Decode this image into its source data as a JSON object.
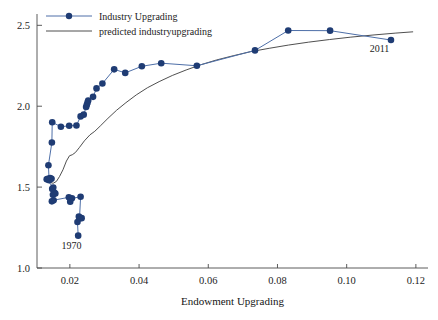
{
  "chart_data": {
    "type": "scatter",
    "title": "",
    "subtitle": "",
    "xlabel": "Endowment Upgrading",
    "ylabel": "",
    "xlim": [
      0.0105,
      0.1235
    ],
    "ylim": [
      1.0,
      2.57
    ],
    "grid": false,
    "legend_position": "top-left",
    "x_ticks": [
      0.02,
      0.04,
      0.06,
      0.08,
      0.1,
      0.12
    ],
    "x_tick_labels": [
      "0.02",
      "0.04",
      "0.06",
      "0.08",
      "0.10",
      "0.12"
    ],
    "y_ticks": [
      1.0,
      1.5,
      2.0,
      2.5
    ],
    "y_tick_labels": [
      "1.0",
      "1.5",
      "2.0",
      "2.5"
    ],
    "annotations": [
      {
        "text": "1970",
        "x": 0.0205,
        "y": 1.115
      },
      {
        "text": "2011",
        "x": 0.1095,
        "y": 2.335
      }
    ],
    "series": [
      {
        "name": "Industry Upgrading",
        "style": "line-marker",
        "color": "#1f3c74",
        "line_color": "#4e6fa8",
        "points": [
          [
            0.0224,
            1.2
          ],
          [
            0.0222,
            1.284
          ],
          [
            0.0229,
            1.307
          ],
          [
            0.0234,
            1.308
          ],
          [
            0.0226,
            1.318
          ],
          [
            0.0228,
            1.312
          ],
          [
            0.0231,
            1.44
          ],
          [
            0.0206,
            1.431
          ],
          [
            0.0201,
            1.41
          ],
          [
            0.0197,
            1.437
          ],
          [
            0.0153,
            1.419
          ],
          [
            0.0148,
            1.412
          ],
          [
            0.0151,
            1.452
          ],
          [
            0.0155,
            1.466
          ],
          [
            0.0158,
            1.46
          ],
          [
            0.0149,
            1.489
          ],
          [
            0.0152,
            1.497
          ],
          [
            0.0133,
            1.548
          ],
          [
            0.0136,
            1.552
          ],
          [
            0.0143,
            1.556
          ],
          [
            0.0147,
            1.551
          ],
          [
            0.014,
            1.543
          ],
          [
            0.0138,
            1.635
          ],
          [
            0.0148,
            1.776
          ],
          [
            0.0149,
            1.901
          ],
          [
            0.0174,
            1.873
          ],
          [
            0.0198,
            1.879
          ],
          [
            0.0219,
            1.881
          ],
          [
            0.0231,
            1.937
          ],
          [
            0.024,
            1.948
          ],
          [
            0.0247,
            1.995
          ],
          [
            0.0249,
            2.009
          ],
          [
            0.0251,
            2.022
          ],
          [
            0.0253,
            2.035
          ],
          [
            0.0267,
            2.058
          ],
          [
            0.0277,
            2.11
          ],
          [
            0.0294,
            2.14
          ],
          [
            0.0328,
            2.228
          ],
          [
            0.036,
            2.206
          ],
          [
            0.0408,
            2.247
          ],
          [
            0.0464,
            2.266
          ],
          [
            0.0567,
            2.25
          ],
          [
            0.0735,
            2.345
          ],
          [
            0.0831,
            2.468
          ],
          [
            0.0952,
            2.467
          ],
          [
            0.1128,
            2.409
          ]
        ]
      },
      {
        "name": "predicted industryupgrading",
        "style": "line",
        "color": "#3b3b3b",
        "points": [
          [
            0.0129,
            1.56
          ],
          [
            0.0136,
            1.545
          ],
          [
            0.0144,
            1.528
          ],
          [
            0.0152,
            1.524
          ],
          [
            0.0161,
            1.535
          ],
          [
            0.017,
            1.565
          ],
          [
            0.018,
            1.607
          ],
          [
            0.019,
            1.661
          ],
          [
            0.0199,
            1.694
          ],
          [
            0.0207,
            1.7
          ],
          [
            0.0216,
            1.714
          ],
          [
            0.0228,
            1.746
          ],
          [
            0.0242,
            1.786
          ],
          [
            0.0258,
            1.823
          ],
          [
            0.0272,
            1.845
          ],
          [
            0.0288,
            1.878
          ],
          [
            0.031,
            1.925
          ],
          [
            0.0335,
            1.975
          ],
          [
            0.0362,
            2.022
          ],
          [
            0.0392,
            2.07
          ],
          [
            0.0424,
            2.114
          ],
          [
            0.0458,
            2.152
          ],
          [
            0.0496,
            2.19
          ],
          [
            0.0536,
            2.224
          ],
          [
            0.0578,
            2.256
          ],
          [
            0.0624,
            2.286
          ],
          [
            0.0672,
            2.312
          ],
          [
            0.0722,
            2.337
          ],
          [
            0.0776,
            2.358
          ],
          [
            0.0832,
            2.378
          ],
          [
            0.089,
            2.396
          ],
          [
            0.095,
            2.412
          ],
          [
            0.1012,
            2.427
          ],
          [
            0.1076,
            2.44
          ],
          [
            0.1142,
            2.452
          ],
          [
            0.1192,
            2.46
          ]
        ]
      }
    ]
  },
  "legend": {
    "items": [
      {
        "label": "Industry Upgrading",
        "marker": true
      },
      {
        "label": "predicted industryupgrading",
        "marker": false
      }
    ]
  }
}
